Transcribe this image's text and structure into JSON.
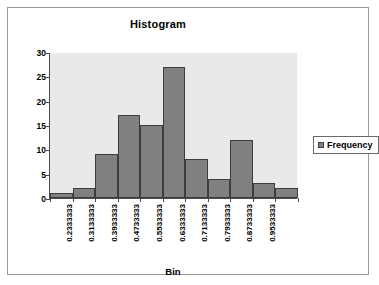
{
  "chart_data": {
    "type": "bar",
    "title": "Histogram",
    "xlabel": "Bin",
    "ylabel": "Frequency",
    "categories": [
      "0.2333333",
      "0.3133333",
      "0.3933333",
      "0.4733333",
      "0.5533333",
      "0.6333333",
      "0.7133333",
      "0.7933333",
      "0.8733333",
      "0.9533333",
      ""
    ],
    "values": [
      1,
      2,
      9,
      17,
      15,
      27,
      8,
      4,
      12,
      3,
      2
    ],
    "series": [
      {
        "name": "Frequency",
        "values": [
          1,
          2,
          9,
          17,
          15,
          27,
          8,
          4,
          12,
          3,
          2
        ]
      }
    ],
    "ylim": [
      0,
      30
    ],
    "ytick_labels": [
      "0",
      "5",
      "10",
      "15",
      "20",
      "25",
      "30"
    ],
    "ytick_values": [
      0,
      5,
      10,
      15,
      20,
      25,
      30
    ],
    "grid": false,
    "legend_position": "right",
    "bar_color": "#808080",
    "bar_border_color": "#3d3d3d",
    "plot_background": "#e9e9e9"
  },
  "legend": {
    "entries": [
      {
        "label": "Frequency",
        "color": "#808080"
      }
    ]
  }
}
